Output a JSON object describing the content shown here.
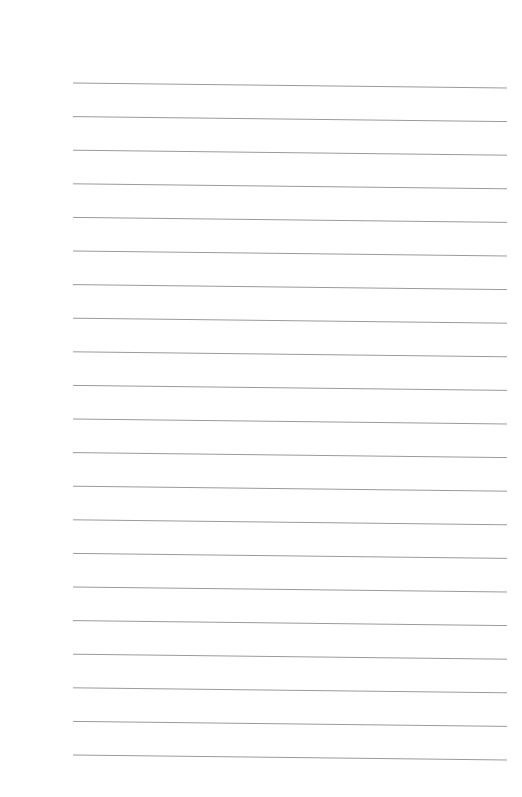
{
  "page": {
    "type": "lined-paper",
    "background": "#ffffff",
    "line_color": "#9a9a9a",
    "line_count": 21,
    "first_line_y_left": 83,
    "first_line_y_right": 88,
    "line_spacing": 33.6,
    "line_x_start": 73,
    "line_x_end": 507
  }
}
